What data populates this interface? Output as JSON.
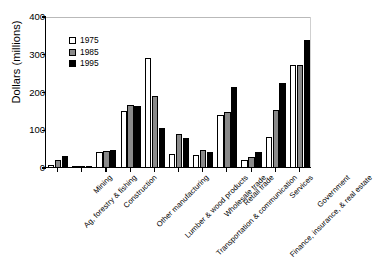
{
  "chart_data": {
    "type": "bar",
    "title": "",
    "xlabel": "",
    "ylabel": "Dollars (millions)",
    "ylim": [
      0,
      400
    ],
    "yticks": [
      0,
      100,
      200,
      300,
      400
    ],
    "grid": false,
    "legend_position": "top-left",
    "categories": [
      "Ag, forestry & fishing",
      "Mining",
      "Construction",
      "Other manufacturing",
      "Lumber & wood products",
      "Transportation & communication",
      "Wholesale trade",
      "Retail trade",
      "Finance, insurance, & real estate",
      "Services",
      "Government"
    ],
    "series": [
      {
        "name": "1975",
        "color": "#ffffff",
        "values": [
          8,
          2,
          42,
          150,
          292,
          38,
          35,
          140,
          20,
          82,
          272
        ]
      },
      {
        "name": "1985",
        "color": "#8a8a8a",
        "values": [
          22,
          3,
          45,
          168,
          192,
          90,
          48,
          148,
          30,
          155,
          274
        ]
      },
      {
        "name": "1995",
        "color": "#000000",
        "values": [
          32,
          4,
          48,
          165,
          105,
          80,
          42,
          215,
          42,
          225,
          340
        ]
      }
    ]
  },
  "legend": {
    "items": [
      {
        "label": "1975",
        "color": "#ffffff"
      },
      {
        "label": "1985",
        "color": "#8a8a8a"
      },
      {
        "label": "1995",
        "color": "#000000"
      }
    ]
  },
  "axes": {
    "y_title": "Dollars (millions)",
    "y_tick_labels": [
      "0",
      "100",
      "200",
      "300",
      "400"
    ]
  }
}
